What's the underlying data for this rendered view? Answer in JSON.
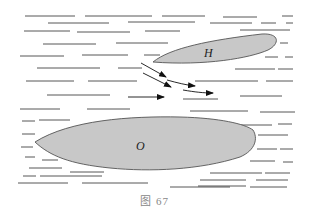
{
  "figure": {
    "caption": "图 67",
    "ship_top_label": "H",
    "ship_bottom_label": "O",
    "colors": {
      "hull_fill": "#c8c8c8",
      "hull_stroke": "#555555",
      "water_line": "#444444",
      "arrow": "#111111",
      "caption": "#888888"
    }
  }
}
